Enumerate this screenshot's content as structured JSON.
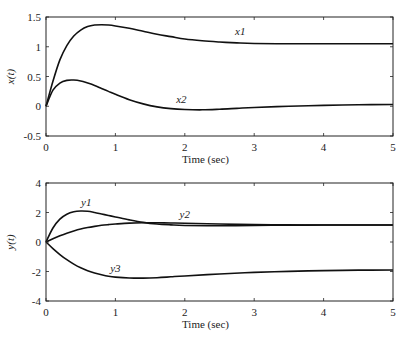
{
  "chart_data": [
    {
      "type": "line",
      "title": "",
      "xlabel": "Time (sec)",
      "ylabel": "x(t)",
      "xlim": [
        0,
        5
      ],
      "ylim": [
        -0.5,
        1.5
      ],
      "xticks": [
        "0",
        "1",
        "2",
        "3",
        "4",
        "5"
      ],
      "yticks": [
        "-0.5",
        "0",
        "0.5",
        "1",
        "1.5"
      ],
      "grid": false,
      "legend": "inline labels",
      "x": [
        0,
        0.1,
        0.2,
        0.3,
        0.4,
        0.5,
        0.6,
        0.7,
        0.8,
        0.9,
        1.0,
        1.2,
        1.4,
        1.6,
        1.8,
        2.0,
        2.25,
        2.5,
        2.75,
        3.0,
        3.5,
        4.0,
        4.5,
        5.0
      ],
      "series": [
        {
          "name": "x1",
          "values": [
            0,
            0.42,
            0.78,
            1.02,
            1.18,
            1.28,
            1.34,
            1.365,
            1.37,
            1.365,
            1.35,
            1.31,
            1.26,
            1.21,
            1.17,
            1.13,
            1.1,
            1.08,
            1.065,
            1.055,
            1.05,
            1.05,
            1.05,
            1.05
          ]
        },
        {
          "name": "x2",
          "values": [
            0,
            0.27,
            0.39,
            0.435,
            0.44,
            0.425,
            0.39,
            0.35,
            0.3,
            0.25,
            0.2,
            0.11,
            0.04,
            -0.01,
            -0.04,
            -0.055,
            -0.06,
            -0.05,
            -0.035,
            -0.02,
            0.0,
            0.015,
            0.025,
            0.03
          ]
        }
      ],
      "annotations": [
        {
          "text": "x1",
          "x": 2.8,
          "y": 1.2
        },
        {
          "text": "x2",
          "x": 1.95,
          "y": 0.05
        }
      ]
    },
    {
      "type": "line",
      "title": "",
      "xlabel": "Time (sec)",
      "ylabel": "y(t)",
      "xlim": [
        0,
        5
      ],
      "ylim": [
        -4,
        4
      ],
      "xticks": [
        "0",
        "1",
        "2",
        "3",
        "4",
        "5"
      ],
      "yticks": [
        "-4",
        "-2",
        "0",
        "2",
        "4"
      ],
      "grid": false,
      "legend": "inline labels",
      "x": [
        0,
        0.1,
        0.2,
        0.3,
        0.4,
        0.5,
        0.6,
        0.7,
        0.8,
        0.9,
        1.0,
        1.2,
        1.4,
        1.6,
        1.8,
        2.0,
        2.5,
        3.0,
        3.5,
        4.0,
        4.5,
        5.0
      ],
      "series": [
        {
          "name": "y1",
          "values": [
            0,
            0.95,
            1.55,
            1.88,
            2.05,
            2.1,
            2.08,
            2.0,
            1.9,
            1.8,
            1.7,
            1.5,
            1.33,
            1.22,
            1.16,
            1.12,
            1.1,
            1.12,
            1.14,
            1.15,
            1.15,
            1.15
          ]
        },
        {
          "name": "y2",
          "values": [
            0,
            0.22,
            0.42,
            0.6,
            0.75,
            0.88,
            0.98,
            1.06,
            1.13,
            1.18,
            1.22,
            1.28,
            1.3,
            1.3,
            1.29,
            1.27,
            1.22,
            1.18,
            1.16,
            1.15,
            1.15,
            1.15
          ]
        },
        {
          "name": "y3",
          "values": [
            0,
            -0.45,
            -0.85,
            -1.2,
            -1.5,
            -1.75,
            -1.95,
            -2.1,
            -2.22,
            -2.32,
            -2.38,
            -2.44,
            -2.45,
            -2.42,
            -2.36,
            -2.3,
            -2.17,
            -2.06,
            -1.99,
            -1.94,
            -1.91,
            -1.9
          ]
        }
      ],
      "annotations": [
        {
          "text": "y1",
          "x": 0.58,
          "y": 2.45
        },
        {
          "text": "y2",
          "x": 2.0,
          "y": 1.6
        },
        {
          "text": "y3",
          "x": 1.0,
          "y": -2.0
        }
      ]
    }
  ],
  "labels": {
    "top_ylabel": "x(t)",
    "bottom_ylabel": "y(t)",
    "xlabel": "Time (sec)"
  }
}
